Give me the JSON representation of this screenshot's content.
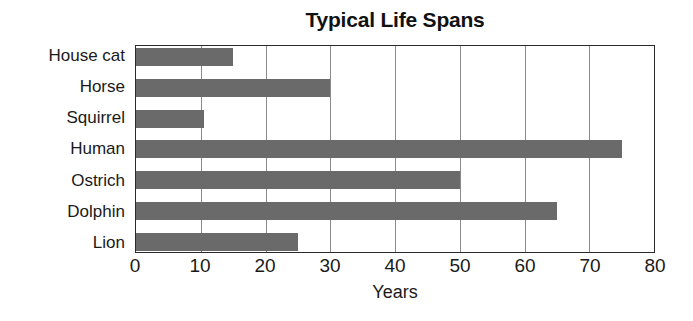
{
  "chart_data": {
    "type": "bar",
    "orientation": "horizontal",
    "title": "Typical Life Spans",
    "xlabel": "Years",
    "ylabel": "",
    "categories": [
      "House cat",
      "Horse",
      "Squirrel",
      "Human",
      "Ostrich",
      "Dolphin",
      "Lion"
    ],
    "values": [
      15,
      30,
      10.5,
      75,
      50,
      65,
      25
    ],
    "xlim": [
      0,
      80
    ],
    "xticks": [
      0,
      10,
      20,
      30,
      40,
      50,
      60,
      70,
      80
    ],
    "xtick_labels": [
      "0",
      "10",
      "20",
      "30",
      "40",
      "50",
      "60",
      "70",
      "80"
    ],
    "grid": "vertical",
    "legend": "none",
    "bar_color": "#6a6a6a",
    "frame_color": "#2a2a2a",
    "gridline_color": "#8a8a8a"
  }
}
